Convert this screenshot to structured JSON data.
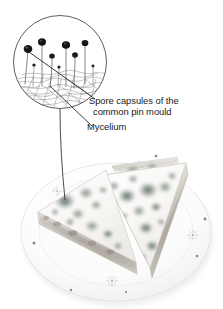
{
  "figure": {
    "background_color": "#ffffff",
    "width": 223,
    "height": 309
  },
  "labels": [
    {
      "id": "spore-capsules",
      "line1": "Spore capsules of the",
      "line2": "common pin mould",
      "full_text": "Spore capsules of the common pin mould",
      "color": "#1a1a1a"
    },
    {
      "id": "mycelium",
      "line1": "Mycelium",
      "full_text": "Mycelium",
      "color": "#1a1a1a"
    }
  ],
  "inset": {
    "name": "magnified-circle-inset",
    "shape": "circle",
    "center_x": 60,
    "center_y": 62,
    "radius": 47,
    "stroke_color": "#4d4d4d",
    "contents": "Line drawing of pin mould: sporangia on upright stalks rising from a tangled mycelium mat",
    "sporangia_count": 6,
    "sporangium_color": "#1a1a1a",
    "hypha_color": "#6e6e6e"
  },
  "leader_lines": [
    {
      "name": "leader-spore-capsules",
      "from": "sporangium-head-left",
      "to": "spore-capsules-label"
    },
    {
      "name": "leader-mycelium",
      "from": "mycelium-mat",
      "to": "mycelium-label"
    },
    {
      "name": "leader-inset-to-photo",
      "from": "inset-circle-bottom",
      "to": "mould-colony-on-sandwich"
    }
  ],
  "photo": {
    "name": "mouldy-sandwiches-photograph",
    "subject": "Two white bread sandwich triangles covered in mould colonies on a patterned white plate",
    "plate": {
      "center_x": 116,
      "center_y": 232,
      "radius_x": 96,
      "radius_y": 70,
      "rim_color": "#e9eaec",
      "face_color": "#fbfbfc",
      "motif": "starburst-floral",
      "motif_count": 5
    },
    "mould_color": "#9aa59d",
    "mould_color_dark": "#76837b",
    "bread_color": "#f7f6f3",
    "filling_color": "#b9b4ac",
    "colony_count": 22
  }
}
